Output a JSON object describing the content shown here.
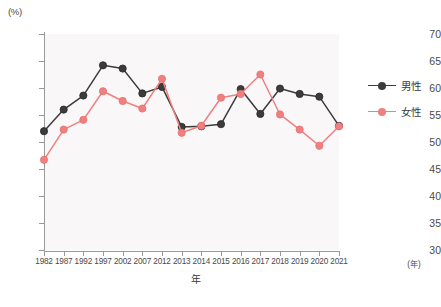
{
  "axes": {
    "y_unit_label": "(%)",
    "x_axis_title": "年",
    "x_unit_label": "(年)",
    "y_ticks": [
      "70",
      "65",
      "60",
      "55",
      "50",
      "45",
      "40",
      "35",
      "30"
    ]
  },
  "legend": {
    "position": "right",
    "items": [
      {
        "label": "男性",
        "color": "#3c3c3c"
      },
      {
        "label": "女性",
        "color": "#f08080"
      }
    ]
  },
  "colors": {
    "male": "#3c3c3c",
    "female": "#f08080",
    "plot_background": "#faf7f8",
    "axis": "#9a9a9a",
    "text": "#3a3a3a"
  },
  "chart_data": {
    "type": "line",
    "title": "",
    "xlabel": "年",
    "ylabel": "(%)",
    "ylim": [
      30,
      70
    ],
    "ytick_step": 5,
    "grid": false,
    "legend_position": "right",
    "categories": [
      "1982",
      "1987",
      "1992",
      "1997",
      "2002",
      "2007",
      "2012",
      "2013",
      "2014",
      "2015",
      "2016",
      "2017",
      "2018",
      "2019",
      "2020",
      "2021"
    ],
    "series": [
      {
        "name": "男性",
        "color": "#3c3c3c",
        "values": [
          52.0,
          56.0,
          58.6,
          64.2,
          63.6,
          59.0,
          60.2,
          52.8,
          52.9,
          53.3,
          59.8,
          55.2,
          59.9,
          58.9,
          58.4,
          53.0
        ]
      },
      {
        "name": "女性",
        "color": "#f08080",
        "values": [
          46.7,
          52.3,
          54.1,
          59.4,
          57.6,
          56.2,
          61.7,
          51.7,
          53.0,
          58.2,
          58.9,
          62.5,
          55.1,
          52.3,
          49.3,
          52.9
        ]
      }
    ]
  }
}
